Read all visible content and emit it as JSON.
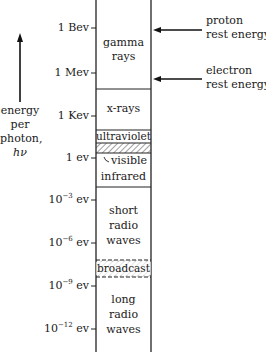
{
  "axis_label": {
    "lines": [
      "energy",
      "per",
      "photon,",
      "hν"
    ]
  },
  "ticks": [
    {
      "id": "1bev",
      "text": "1 Bev",
      "y": 28
    },
    {
      "id": "1mev",
      "text": "1 Mev",
      "y": 73
    },
    {
      "id": "1kev",
      "text": "1 Kev",
      "y": 116
    },
    {
      "id": "1ev",
      "text": "1 ev",
      "y": 158
    },
    {
      "id": "1e-3",
      "base": "10",
      "exp": "−3",
      "unit": " ev",
      "y": 200
    },
    {
      "id": "1e-6",
      "base": "10",
      "exp": "−6",
      "unit": " ev",
      "y": 243
    },
    {
      "id": "1e-9",
      "base": "10",
      "exp": "−9",
      "unit": " ev",
      "y": 286
    },
    {
      "id": "1e-12",
      "base": "10",
      "exp": "−12",
      "unit": " ev",
      "y": 329
    }
  ],
  "bands": {
    "gamma": [
      "gamma",
      "rays"
    ],
    "xrays": [
      "x-rays"
    ],
    "ultraviolet": [
      "ultraviolet"
    ],
    "visible": [
      "visible"
    ],
    "infrared": [
      "infrared"
    ],
    "short_radio": [
      "short",
      "radio",
      "waves"
    ],
    "broadcast": [
      "broadcast"
    ],
    "long_radio": [
      "long",
      "radio",
      "waves"
    ]
  },
  "annotations": {
    "proton": [
      "proton",
      "rest energy"
    ],
    "electron": [
      "electron",
      "rest energy"
    ]
  }
}
